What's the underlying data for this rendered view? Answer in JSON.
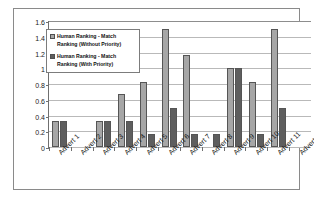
{
  "chart_data": {
    "type": "bar",
    "title": "",
    "subtitle": "",
    "xlabel": "",
    "ylabel": "",
    "ylim": [
      0,
      1.6
    ],
    "yticks": [
      0,
      0.2,
      0.4,
      0.6,
      0.8,
      1,
      1.2,
      1.4,
      1.6
    ],
    "ytick_labels": [
      "0",
      "0.2",
      "0.4",
      "0.6",
      "0.8",
      "1",
      "1.2",
      "1.4",
      "1.6"
    ],
    "grid": true,
    "legend_position": "upper-left-inside",
    "categories": [
      "Advert 1",
      "Advert 2",
      "Advert 3",
      "Advert 4",
      "Advert 5",
      "Advert 6",
      "Advert 7",
      "Advert 8",
      "Advert 9",
      "Advert 10",
      "Advert 11",
      "Advert 12"
    ],
    "series": [
      {
        "name": "Human Ranking - Match Ranking (Without Priority)",
        "color": "#a6a6a6",
        "values": [
          0.33,
          0,
          0.33,
          0.67,
          0.83,
          1.5,
          1.17,
          0,
          1.0,
          0.83,
          1.5,
          0
        ]
      },
      {
        "name": "Human Ranking - Match Ranking (With Priority)",
        "color": "#5e5e5e",
        "values": [
          0.33,
          0,
          0.33,
          0.33,
          0.17,
          0.5,
          0.17,
          0.17,
          1.0,
          0.17,
          0.5,
          0
        ]
      }
    ]
  },
  "legend": {
    "entries": [
      {
        "label": "Human Ranking - Match Ranking (Without Priority)"
      },
      {
        "label": "Human Ranking - Match Ranking (With Priority)"
      }
    ]
  }
}
